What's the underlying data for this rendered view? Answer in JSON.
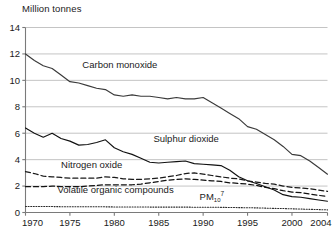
{
  "chart_data": {
    "type": "line",
    "title": "Million tonnes",
    "xlabel": "",
    "ylabel": "Million tonnes",
    "xlim": [
      1970,
      2004
    ],
    "ylim": [
      0,
      14
    ],
    "yticks": [
      0,
      2,
      4,
      6,
      8,
      10,
      12,
      14
    ],
    "xticks": [
      1970,
      1975,
      1980,
      1985,
      1990,
      1995,
      2000,
      2004
    ],
    "grid": "horizontal",
    "legend_position": "inline-annotations",
    "x": [
      1970,
      1971,
      1972,
      1973,
      1974,
      1975,
      1976,
      1977,
      1978,
      1979,
      1980,
      1981,
      1982,
      1983,
      1984,
      1985,
      1986,
      1987,
      1988,
      1989,
      1990,
      1991,
      1992,
      1993,
      1994,
      1995,
      1996,
      1997,
      1998,
      1999,
      2000,
      2001,
      2002,
      2003,
      2004
    ],
    "series": [
      {
        "name": "Carbon monoxide",
        "style": "solid",
        "color": "#3a3a3a",
        "label_x": 1976.4,
        "label_y": 10.9,
        "values": [
          12.0,
          11.5,
          11.1,
          10.9,
          10.4,
          9.9,
          9.8,
          9.6,
          9.4,
          9.3,
          8.9,
          8.8,
          8.9,
          8.8,
          8.8,
          8.7,
          8.6,
          8.7,
          8.6,
          8.6,
          8.7,
          8.3,
          7.9,
          7.5,
          7.1,
          6.5,
          6.3,
          5.9,
          5.5,
          5.0,
          4.4,
          4.3,
          3.9,
          3.4,
          2.9
        ]
      },
      {
        "name": "Sulphur dioxide",
        "style": "solid",
        "color": "#111111",
        "label_x": 1984.4,
        "label_y": 5.35,
        "values": [
          6.4,
          6.0,
          5.7,
          6.0,
          5.6,
          5.4,
          5.1,
          5.15,
          5.3,
          5.5,
          4.9,
          4.6,
          4.4,
          4.1,
          3.8,
          3.75,
          3.8,
          3.85,
          3.9,
          3.7,
          3.65,
          3.6,
          3.55,
          3.2,
          2.7,
          2.4,
          2.2,
          1.95,
          1.7,
          1.35,
          1.2,
          1.15,
          1.05,
          0.95,
          0.85
        ]
      },
      {
        "name": "Nitrogen oxide",
        "style": "dashed",
        "color": "#1a1a1a",
        "label_x": 1974.0,
        "label_y": 3.35,
        "values": [
          3.1,
          2.95,
          2.75,
          2.7,
          2.65,
          2.6,
          2.6,
          2.6,
          2.6,
          2.7,
          2.65,
          2.55,
          2.5,
          2.5,
          2.55,
          2.6,
          2.7,
          2.8,
          2.95,
          3.0,
          2.9,
          2.8,
          2.7,
          2.6,
          2.55,
          2.4,
          2.3,
          2.2,
          2.15,
          2.0,
          1.9,
          1.85,
          1.8,
          1.7,
          1.6
        ]
      },
      {
        "name": "Volatile organic compounds",
        "style": "dashed",
        "color": "#111111",
        "label_x": 1973.6,
        "label_y": 1.45,
        "values": [
          1.95,
          1.95,
          1.95,
          2.0,
          1.95,
          1.95,
          1.95,
          2.0,
          2.05,
          2.1,
          2.1,
          2.1,
          2.1,
          2.15,
          2.25,
          2.35,
          2.45,
          2.5,
          2.55,
          2.5,
          2.45,
          2.4,
          2.35,
          2.25,
          2.2,
          2.15,
          2.05,
          1.9,
          1.8,
          1.65,
          1.55,
          1.5,
          1.4,
          1.3,
          1.2
        ]
      },
      {
        "name": "PM10",
        "label_base": "PM",
        "label_subscript": "10",
        "label_superscript": "7",
        "style": "dotted",
        "color": "#2a2a2a",
        "label_x": 1989.6,
        "label_y": 0.95,
        "values": [
          0.45,
          0.45,
          0.45,
          0.45,
          0.44,
          0.44,
          0.43,
          0.43,
          0.43,
          0.43,
          0.42,
          0.42,
          0.42,
          0.42,
          0.41,
          0.41,
          0.41,
          0.41,
          0.41,
          0.4,
          0.4,
          0.4,
          0.39,
          0.38,
          0.37,
          0.36,
          0.35,
          0.33,
          0.31,
          0.3,
          0.28,
          0.26,
          0.24,
          0.22,
          0.2
        ]
      }
    ]
  },
  "axis": {
    "ytick_labels": [
      "0",
      "2",
      "4",
      "6",
      "8",
      "10",
      "12",
      "14"
    ],
    "xtick_labels": [
      "1970",
      "1975",
      "1980",
      "1985",
      "1990",
      "1995",
      "2000",
      "2004"
    ]
  },
  "colors": {
    "grid": "#b5b5b5",
    "axis": "#7a7a7a",
    "text": "#1a1a1a"
  }
}
